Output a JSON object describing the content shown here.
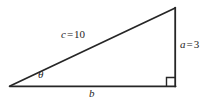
{
  "figure": {
    "kind": "right-triangle-diagram",
    "background_color": "#ffffff",
    "stroke_color": "#262626"
  },
  "labels": {
    "hypotenuse": {
      "variable": "c",
      "equals": "=",
      "value": "10",
      "full_text": "c = 10"
    },
    "opposite_side": {
      "variable": "a",
      "equals": "=",
      "value": "3",
      "full_text": "a = 3"
    },
    "adjacent_side": {
      "variable": "b",
      "full_text": "b"
    },
    "angle": {
      "symbol": "θ",
      "full_text": "θ"
    }
  },
  "geometry": {
    "vertex_left": "10,86",
    "vertex_top_right": "175,8",
    "vertex_bottom_right": "175,86",
    "right_angle_marker": "bottom-right"
  }
}
